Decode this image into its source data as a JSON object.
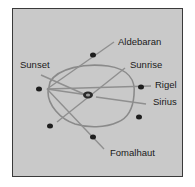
{
  "diagram": {
    "type": "astronomical-alignment-stone-circle",
    "labels": {
      "aldebaran": "Aldebaran",
      "sunset": "Sunset",
      "sunrise": "Sunrise",
      "rigel": "Rigel",
      "sirius": "Sirius",
      "fomalhaut": "Fomalhaut"
    },
    "colors": {
      "background": "#c9c9c9",
      "border": "#3a3a3a",
      "line": "#8a8a8a",
      "stone": "#1e1e1e",
      "text": "#1a1a1a"
    }
  }
}
